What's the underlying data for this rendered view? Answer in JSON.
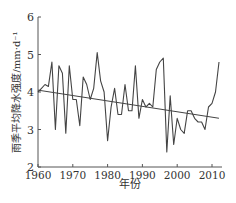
{
  "chart_data": {
    "type": "line",
    "title": "",
    "xlabel": "年份",
    "ylabel": "雨季平均降水强度/mm·d⁻¹",
    "xlim": [
      1960,
      2013
    ],
    "ylim": [
      2,
      6
    ],
    "xticks": [
      1960,
      1970,
      1980,
      1990,
      2000,
      2010
    ],
    "yticks": [
      2,
      3,
      4,
      5,
      6
    ],
    "grid": false,
    "legend": null,
    "x": [
      1960,
      1961,
      1962,
      1963,
      1964,
      1965,
      1966,
      1967,
      1968,
      1969,
      1970,
      1971,
      1972,
      1973,
      1974,
      1975,
      1976,
      1977,
      1978,
      1979,
      1980,
      1981,
      1982,
      1983,
      1984,
      1985,
      1986,
      1987,
      1988,
      1989,
      1990,
      1991,
      1992,
      1993,
      1994,
      1995,
      1996,
      1997,
      1998,
      1999,
      2000,
      2001,
      2002,
      2003,
      2004,
      2005,
      2006,
      2007,
      2008,
      2009,
      2010,
      2011,
      2012
    ],
    "series": [
      {
        "name": "雨季平均降水强度",
        "values": [
          4.0,
          4.1,
          4.2,
          4.15,
          4.8,
          3.0,
          4.7,
          4.5,
          2.9,
          4.7,
          3.8,
          3.8,
          3.1,
          4.4,
          4.2,
          3.8,
          4.1,
          5.05,
          4.3,
          4.0,
          2.7,
          3.6,
          4.1,
          3.4,
          3.4,
          4.2,
          3.5,
          3.5,
          4.7,
          3.3,
          3.8,
          3.6,
          3.7,
          3.6,
          4.6,
          4.8,
          4.9,
          2.4,
          3.9,
          2.6,
          3.3,
          3.0,
          2.9,
          3.5,
          3.5,
          3.3,
          3.2,
          3.2,
          3.0,
          3.6,
          3.7,
          4.0,
          4.8
        ]
      },
      {
        "name": "线性趋势",
        "x": [
          1960,
          2012
        ],
        "values": [
          4.05,
          3.3
        ]
      }
    ]
  },
  "labels": {
    "xlabel": "年份",
    "ylabel": "雨季平均降水强度/mm·d⁻¹",
    "yticks": [
      "2",
      "3",
      "4",
      "5",
      "6"
    ],
    "xticks": [
      "1960",
      "1970",
      "1980",
      "1990",
      "2000",
      "2010"
    ]
  }
}
